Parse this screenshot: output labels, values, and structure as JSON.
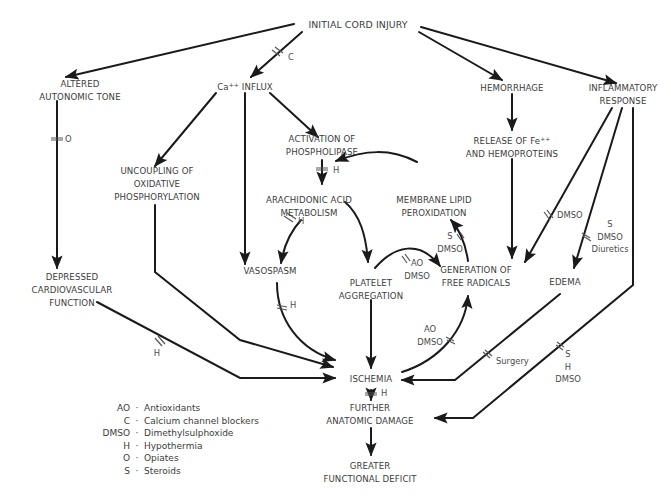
{
  "nodes": {
    "initial": "INITIAL CORD INJURY",
    "altered": [
      "ALTERED",
      "AUTONOMIC TONE"
    ],
    "ca_influx": "Ca++ INFLUX",
    "hemorrhage": "HEMORRHAGE",
    "inflammatory": [
      "INFLAMMATORY",
      "RESPONSE"
    ],
    "activation": [
      "ACTIVATION OF",
      "PHOSPHOLIPASE"
    ],
    "uncoupling": [
      "UNCOUPLING OF",
      "OXIDATIVE",
      "PHOSPHORYLATION"
    ],
    "release": [
      "RELEASE OF Fe++",
      "AND HEMOPROTEINS"
    ],
    "arachidonic": [
      "ARACHIDONIC ACID",
      "METABOLISM"
    ],
    "membrane": [
      "MEMBRANE LIPID",
      "PEROXIDATION"
    ],
    "vasospasm": "VASOSPASM",
    "platelet": [
      "PLATELET",
      "AGGREGATION"
    ],
    "generation": [
      "GENERATION OF",
      "FREE RADICALS"
    ],
    "edema": "EDEMA",
    "depressed": [
      "DEPRESSED",
      "CARDIOVASCULAR",
      "FUNCTION"
    ],
    "ischemia": "ISCHEMIA",
    "further": [
      "FURTHER",
      "ANATOMIC DAMAGE"
    ],
    "greater": [
      "GREATER",
      "FUNCTIONAL DEFICIT"
    ]
  },
  "interventions": {
    "c_ca": "C",
    "o_altered": "O",
    "h_phospholipase": "H",
    "h_arachidonic_vaso": "H",
    "s_dmso_membrane": [
      "S",
      "DMSO"
    ],
    "ao_dmso_platelet": [
      "AO",
      "DMSO"
    ],
    "dmso_inflam_radicals": "DMSO",
    "s_dmso_diuretics_edema": [
      "S",
      "DMSO",
      "Diuretics"
    ],
    "h_vaso_ischemia": "H",
    "h_depressed_ischemia": "H",
    "ao_dmso_ischemia_radicals": [
      "AO",
      "DMSO"
    ],
    "surgery_edema": "Surgery",
    "s_h_dmso_further": [
      "S",
      "H",
      "DMSO"
    ],
    "h_ischemia_further": "H"
  },
  "legend": [
    {
      "abbr": "AO",
      "def": "Antioxidants"
    },
    {
      "abbr": "C",
      "def": "Calcium channel blockers"
    },
    {
      "abbr": "DMSO",
      "def": "Dimethylsulphoxide"
    },
    {
      "abbr": "H",
      "def": "Hypothermia"
    },
    {
      "abbr": "O",
      "def": "Opiates"
    },
    {
      "abbr": "S",
      "def": "Steroids"
    }
  ],
  "legend_separator": "·",
  "colors": {
    "line": "#1a1a1a",
    "text": "#3c3c3c"
  }
}
